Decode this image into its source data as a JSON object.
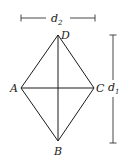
{
  "figure": {
    "vertices": {
      "A": {
        "label": "A",
        "x": 21,
        "y": 88
      },
      "B": {
        "label": "B",
        "x": 58,
        "y": 141
      },
      "C": {
        "label": "C",
        "x": 94,
        "y": 88
      },
      "D": {
        "label": "D",
        "x": 58,
        "y": 35
      }
    },
    "dimensions": {
      "d1": {
        "base": "d",
        "subscript": "1",
        "orientation": "vertical"
      },
      "d2": {
        "base": "d",
        "subscript": "2",
        "orientation": "horizontal"
      }
    },
    "stroke_color": "#1a1a1a"
  }
}
